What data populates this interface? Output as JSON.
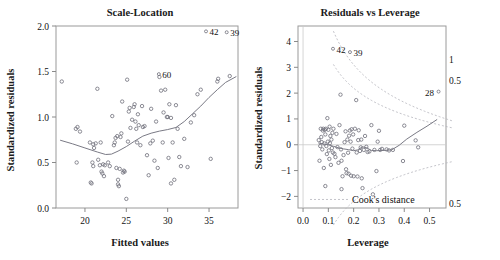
{
  "figure": {
    "kind": "regression-diagnostic-plots",
    "panel_count": 2
  },
  "chart_data": [
    {
      "type": "scatter",
      "id": "scale-location",
      "title": "Scale-Location",
      "xlabel": "Fitted values",
      "ylabel": "Standardized residuals",
      "xlim": [
        16.5,
        38.5
      ],
      "ylim": [
        0.0,
        2.0
      ],
      "xticks": [
        "20",
        "25",
        "30",
        "35"
      ],
      "xtick_values": [
        20,
        25,
        30,
        35
      ],
      "yticks": [
        "0.0",
        "0.5",
        "1.0",
        "1.5",
        "2.0"
      ],
      "ytick_values": [
        0.0,
        0.5,
        1.0,
        1.5,
        2.0
      ],
      "grid": false,
      "legend": "none",
      "marker": "open-circle",
      "x": [
        17.2,
        18.9,
        19.0,
        19.1,
        19.4,
        20.6,
        20.7,
        20.8,
        20.9,
        21.0,
        21.0,
        21.1,
        21.3,
        21.5,
        21.6,
        21.8,
        21.9,
        22.0,
        22.1,
        22.2,
        22.3,
        22.4,
        22.8,
        23.0,
        23.3,
        23.5,
        23.6,
        23.7,
        23.8,
        23.9,
        24.0,
        24.0,
        24.1,
        24.2,
        24.3,
        24.4,
        24.5,
        24.6,
        24.7,
        24.8,
        25.0,
        25.1,
        25.2,
        25.3,
        25.4,
        25.5,
        25.7,
        25.9,
        26.0,
        26.1,
        26.2,
        26.3,
        26.4,
        26.5,
        26.7,
        26.9,
        27.0,
        27.2,
        27.5,
        27.7,
        27.9,
        28.0,
        28.2,
        28.4,
        28.6,
        28.8,
        29.0,
        29.2,
        29.4,
        29.5,
        29.7,
        29.9,
        30.0,
        30.1,
        30.2,
        30.4,
        30.6,
        30.8,
        31.0,
        31.2,
        31.4,
        31.6,
        32.0,
        32.4,
        32.8,
        33.2,
        33.6,
        34.0,
        35.2,
        36.0,
        36.1,
        30.4,
        37.5
      ],
      "y": [
        1.39,
        0.87,
        0.5,
        0.89,
        0.84,
        0.72,
        0.28,
        0.27,
        0.5,
        0.46,
        0.7,
        0.66,
        0.71,
        1.31,
        0.53,
        0.47,
        0.72,
        0.4,
        0.38,
        0.48,
        0.35,
        0.47,
        0.5,
        0.46,
        1.01,
        0.69,
        0.72,
        0.77,
        0.44,
        0.79,
        0.26,
        0.31,
        0.24,
        0.43,
        0.78,
        0.82,
        1.17,
        0.39,
        0.41,
        0.4,
        0.1,
        1.41,
        0.73,
        1.06,
        1.1,
        0.88,
        0.97,
        1.11,
        1.14,
        0.95,
        0.87,
        0.72,
        1.03,
        0.91,
        0.69,
        1.12,
        0.89,
        0.9,
        0.58,
        0.36,
        0.71,
        1.09,
        0.74,
        0.52,
        0.95,
        0.44,
        1.44,
        1.29,
        0.72,
        1.05,
        1.3,
        1.0,
        1.0,
        0.55,
        1.14,
        0.27,
        0.72,
        0.31,
        1.13,
        0.87,
        0.56,
        0.46,
        0.76,
        0.45,
        0.94,
        1.02,
        1.25,
        1.3,
        0.54,
        1.39,
        1.42,
        0.99,
        1.45
      ],
      "lowess": [
        [
          17.0,
          0.745
        ],
        [
          18.5,
          0.705
        ],
        [
          20.0,
          0.66
        ],
        [
          21.5,
          0.615
        ],
        [
          22.5,
          0.588
        ],
        [
          23.2,
          0.592
        ],
        [
          24.0,
          0.625
        ],
        [
          25.0,
          0.675
        ],
        [
          26.0,
          0.735
        ],
        [
          27.0,
          0.79
        ],
        [
          28.0,
          0.822
        ],
        [
          29.0,
          0.845
        ],
        [
          30.0,
          0.862
        ],
        [
          31.0,
          0.885
        ],
        [
          32.0,
          0.95
        ],
        [
          33.0,
          1.035
        ],
        [
          34.0,
          1.12
        ],
        [
          35.0,
          1.215
        ],
        [
          36.0,
          1.3
        ],
        [
          37.0,
          1.38
        ],
        [
          38.3,
          1.445
        ]
      ],
      "point_labels": [
        {
          "text": "42",
          "x": 35.6,
          "y": 1.93
        },
        {
          "text": "39",
          "x": 38.1,
          "y": 1.92
        },
        {
          "text": "60",
          "x": 29.9,
          "y": 1.46
        }
      ]
    },
    {
      "type": "scatter",
      "id": "residuals-vs-leverage",
      "title": "Residuals vs Leverage",
      "xlabel": "Leverage",
      "ylabel": "Standardized residuals",
      "xlim": [
        -0.02,
        0.565
      ],
      "ylim": [
        -2.45,
        4.6
      ],
      "xticks": [
        "0.0",
        "0.1",
        "0.2",
        "0.3",
        "0.4",
        "0.5"
      ],
      "xtick_values": [
        0.0,
        0.1,
        0.2,
        0.3,
        0.4,
        0.5
      ],
      "yticks": [
        "-2",
        "-1",
        "0",
        "1",
        "2",
        "3",
        "4"
      ],
      "ytick_values": [
        -2,
        -1,
        0,
        1,
        2,
        3,
        4
      ],
      "grid": false,
      "marker": "open-circle",
      "zero_reference_line": 0,
      "x": [
        0.062,
        0.065,
        0.068,
        0.07,
        0.072,
        0.074,
        0.076,
        0.078,
        0.08,
        0.082,
        0.084,
        0.086,
        0.088,
        0.09,
        0.092,
        0.094,
        0.096,
        0.098,
        0.1,
        0.102,
        0.104,
        0.106,
        0.108,
        0.11,
        0.112,
        0.114,
        0.116,
        0.118,
        0.12,
        0.124,
        0.128,
        0.132,
        0.136,
        0.14,
        0.144,
        0.148,
        0.15,
        0.152,
        0.156,
        0.16,
        0.164,
        0.168,
        0.17,
        0.172,
        0.175,
        0.178,
        0.18,
        0.182,
        0.185,
        0.188,
        0.19,
        0.192,
        0.195,
        0.198,
        0.2,
        0.205,
        0.21,
        0.212,
        0.215,
        0.218,
        0.22,
        0.225,
        0.228,
        0.23,
        0.235,
        0.24,
        0.245,
        0.25,
        0.255,
        0.262,
        0.27,
        0.276,
        0.282,
        0.29,
        0.295,
        0.3,
        0.305,
        0.312,
        0.33,
        0.34,
        0.355,
        0.395,
        0.4,
        0.445,
        0.455,
        0.152,
        0.232,
        0.088,
        0.105
      ],
      "y": [
        0.18,
        -0.62,
        -0.05,
        0.62,
        0.3,
        0.1,
        -0.18,
        0.55,
        0.62,
        -0.9,
        0.05,
        0.58,
        0.4,
        0.62,
        -0.05,
        -0.36,
        1.03,
        0.12,
        0.58,
        -0.22,
        -0.55,
        0.06,
        0.34,
        -0.78,
        0.2,
        -0.13,
        0.46,
        -0.3,
        0.62,
        -0.35,
        -0.48,
        0.42,
        -0.09,
        -0.7,
        0.76,
        1.94,
        -0.18,
        -0.62,
        -1.22,
        -0.4,
        0.1,
        0.52,
        -0.95,
        -1.1,
        0.2,
        -0.31,
        -1.12,
        0.35,
        0.55,
        0.12,
        -1.2,
        0.6,
        -0.15,
        0.4,
        -1.22,
        0.62,
        1.73,
        -0.3,
        -1.23,
        0.18,
        0.56,
        -0.24,
        -0.1,
        0.2,
        -1.68,
        -0.2,
        0.34,
        -0.08,
        -0.28,
        -0.26,
        0.76,
        -1.92,
        -0.2,
        -1.02,
        0.12,
        0.54,
        -0.2,
        -0.16,
        -0.18,
        -0.22,
        -0.2,
        -0.63,
        0.74,
        0.17,
        -0.1,
        -1.72,
        -1.3,
        -1.6,
        0.7
      ],
      "lowess": [
        [
          0.06,
          0.07
        ],
        [
          0.08,
          0.03
        ],
        [
          0.1,
          0.0
        ],
        [
          0.12,
          -0.06
        ],
        [
          0.14,
          -0.12
        ],
        [
          0.16,
          -0.16
        ],
        [
          0.18,
          -0.19
        ],
        [
          0.2,
          -0.23
        ],
        [
          0.215,
          -0.2
        ],
        [
          0.235,
          -0.08
        ],
        [
          0.25,
          -0.11
        ],
        [
          0.27,
          -0.22
        ],
        [
          0.29,
          -0.23
        ],
        [
          0.32,
          -0.22
        ],
        [
          0.35,
          -0.2
        ],
        [
          0.38,
          -0.02
        ],
        [
          0.41,
          0.22
        ],
        [
          0.45,
          0.48
        ],
        [
          0.49,
          0.72
        ],
        [
          0.53,
          0.98
        ]
      ],
      "cooks_distance_label": "Cook's distance",
      "cooks_contour_labels": [
        "1",
        "0.5",
        "0.5"
      ],
      "point_labels": [
        {
          "text": "42",
          "x": 0.15,
          "y": 3.68
        },
        {
          "text": "39",
          "x": 0.217,
          "y": 3.55
        },
        {
          "text": "28",
          "x": 0.5,
          "y": 2.02
        }
      ]
    }
  ]
}
